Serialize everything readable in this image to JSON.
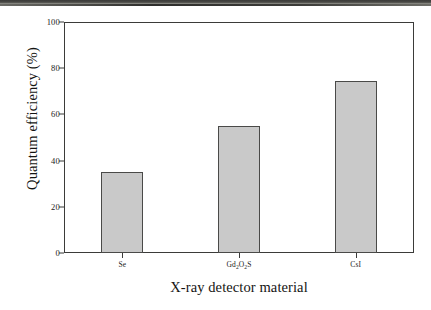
{
  "chart_data": {
    "type": "bar",
    "title": "",
    "xlabel": "X-ray detector material",
    "ylabel": "Quantum efficiency (%)",
    "categories": [
      "Se",
      "Gd2O2S",
      "CsI"
    ],
    "category_labels_html": [
      "Se",
      "Gd<sub>2</sub>O<sub>2</sub>S",
      "CsI"
    ],
    "values": [
      35,
      55,
      74.5
    ],
    "ylim": [
      0,
      100
    ],
    "ytick_labels": [
      "0",
      "20",
      "40",
      "60",
      "80",
      "100"
    ],
    "ytick_values": [
      0,
      20,
      40,
      60,
      80,
      100
    ],
    "grid": false,
    "legend": false,
    "bar_fill_color": "#c9c9c9",
    "bar_edge_color": "#4a4a48",
    "axis_color": "#3b3b39"
  }
}
